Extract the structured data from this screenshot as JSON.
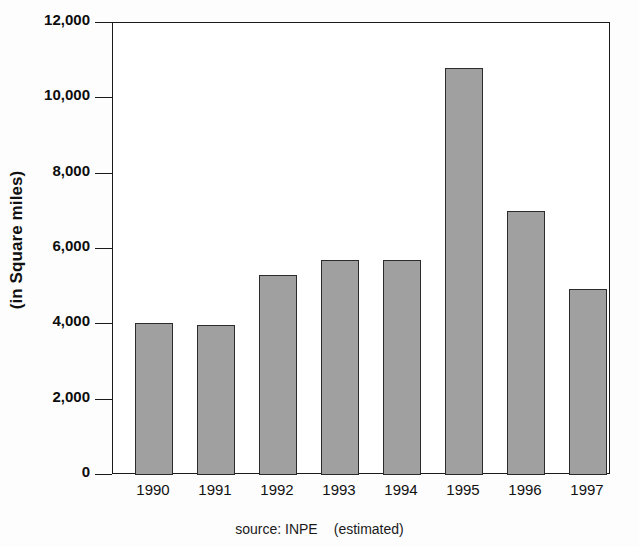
{
  "chart_data": {
    "type": "bar",
    "title": "",
    "xlabel": "",
    "ylabel": "(in Square miles)",
    "categories": [
      "1990",
      "1991",
      "1992",
      "1993",
      "1994",
      "1995",
      "1996",
      "1997"
    ],
    "values": [
      4030,
      3980,
      5310,
      5700,
      5700,
      10800,
      7000,
      4940
    ],
    "ylim": [
      0,
      12000
    ],
    "yticks": [
      0,
      2000,
      4000,
      6000,
      8000,
      10000,
      12000
    ],
    "ytick_labels": [
      "0",
      "2,000",
      "4,000",
      "6,000",
      "8,000",
      "10,000",
      "12,000"
    ],
    "grid": false,
    "legend": "none",
    "bar_color": "#a0a0a0",
    "bar_edge_color": "#2b2b2b",
    "axis_color": "#1a1a1a",
    "background_color": "#ffffff",
    "annotations": {
      "source_prefix": "source: INPE",
      "source_suffix": "(estimated)"
    }
  }
}
